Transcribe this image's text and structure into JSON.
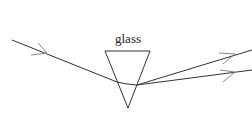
{
  "diagram": {
    "labels": {
      "prism": "glass"
    },
    "colors": {
      "stroke": "#333333",
      "arrow": "#888888",
      "text": "#222222"
    },
    "elements": {
      "prism": {
        "shape": "inverted-triangle",
        "vertices": [
          [
            105,
            51
          ],
          [
            150,
            51
          ],
          [
            128,
            108
          ]
        ]
      },
      "incident_ray": {
        "from": [
          12,
          40
        ],
        "to": [
          117,
          82
        ],
        "arrow_at": [
          45,
          53
        ]
      },
      "internal_ray": {
        "from": [
          117,
          82
        ],
        "to": [
          137,
          85
        ]
      },
      "emergent_rays": [
        {
          "from": [
            137,
            85
          ],
          "to": [
            252,
            50
          ],
          "arrow_at": [
            233,
            55
          ]
        },
        {
          "from": [
            137,
            85
          ],
          "to": [
            252,
            70
          ],
          "arrow_at": [
            233,
            72
          ]
        }
      ]
    }
  }
}
